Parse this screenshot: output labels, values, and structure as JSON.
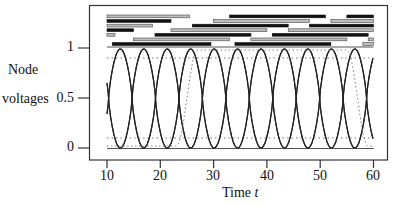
{
  "chart_data": {
    "type": "line",
    "title": "",
    "xlabel": "Time t",
    "ylabel": "Node voltages",
    "xlim": [
      7,
      62
    ],
    "ylim": [
      -0.25,
      1.65
    ],
    "x_ticks": [
      "10",
      "20",
      "30",
      "40",
      "50",
      "60"
    ],
    "y_ticks": [
      "0",
      "0.5",
      "1"
    ],
    "grid": false,
    "legend": null,
    "annotations": {
      "dotted_reference_levels": [
        0.1,
        0.9
      ],
      "event_bars_description": "8 rows of horizontal bars (black = one state, grey outlined = other) above the waveforms, in time units",
      "event_bars": [
        [
          {
            "start": 10,
            "end": 25.5,
            "color": "grey"
          },
          {
            "start": 33,
            "end": 51,
            "color": "black"
          },
          {
            "start": 55,
            "end": 60,
            "color": "black"
          }
        ],
        [
          {
            "start": 10,
            "end": 22,
            "color": "black"
          },
          {
            "start": 30,
            "end": 48,
            "color": "grey"
          },
          {
            "start": 52,
            "end": 60,
            "color": "grey"
          }
        ],
        [
          {
            "start": 10,
            "end": 18.5,
            "color": "grey"
          },
          {
            "start": 26,
            "end": 44,
            "color": "black"
          },
          {
            "start": 48,
            "end": 60,
            "color": "black"
          }
        ],
        [
          {
            "start": 10,
            "end": 15,
            "color": "black"
          },
          {
            "start": 22,
            "end": 40,
            "color": "grey"
          },
          {
            "start": 44,
            "end": 60,
            "color": "grey"
          }
        ],
        [
          {
            "start": 10,
            "end": 11.5,
            "color": "grey"
          },
          {
            "start": 19,
            "end": 37,
            "color": "black"
          },
          {
            "start": 41,
            "end": 59,
            "color": "black"
          }
        ],
        [
          {
            "start": 15,
            "end": 33,
            "color": "grey"
          },
          {
            "start": 37,
            "end": 55,
            "color": "grey"
          },
          {
            "start": 59,
            "end": 60,
            "color": "grey"
          }
        ],
        [
          {
            "start": 11,
            "end": 29.5,
            "color": "black"
          },
          {
            "start": 34,
            "end": 52,
            "color": "black"
          },
          {
            "start": 58,
            "end": 60,
            "color": "grey"
          }
        ]
      ]
    },
    "series": [
      {
        "name": "node-1",
        "style": "solid",
        "description": "periodic ~0..0.95, period ≈ 8.8",
        "phase_peak_t": 12.5
      },
      {
        "name": "node-2",
        "style": "solid",
        "phase_peak_t": 16.9
      },
      {
        "name": "node-3",
        "style": "solid",
        "phase_peak_t": 21.3
      },
      {
        "name": "node-4",
        "style": "solid",
        "phase_peak_t": 25.7
      },
      {
        "name": "node-5",
        "style": "dotted",
        "description": "rises near t≈24-27, stays high, falls near t≈57",
        "rise_t": 25,
        "fall_t": 57
      }
    ]
  },
  "axes": {
    "y_label_line1": "Node",
    "y_label_line2": "voltages",
    "y_tick_0": "0",
    "y_tick_05": "0.5",
    "y_tick_1": "1",
    "x_ticks": [
      "10",
      "20",
      "30",
      "40",
      "50",
      "60"
    ],
    "x_label": "Time",
    "x_label_var": "t"
  }
}
